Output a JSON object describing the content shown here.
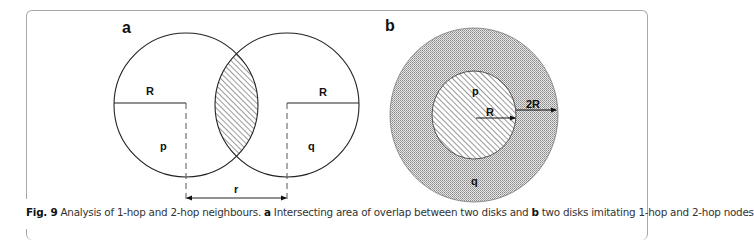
{
  "figure": {
    "panel_a": {
      "label": "a",
      "radius_left": "R",
      "radius_right": "R",
      "node_left": "p",
      "node_right": "q",
      "distance": "r"
    },
    "panel_b": {
      "label": "b",
      "inner_node": "p",
      "outer_node": "q",
      "inner_radius": "R",
      "outer_radius": "2R"
    }
  },
  "caption": {
    "fig_label": "Fig. 9",
    "text_1": " Analysis of 1-hop and 2-hop neighbours. ",
    "a": "a",
    "text_2": " Intersecting area of overlap between two disks and ",
    "b": "b",
    "text_3": " two disks imitating 1-hop and 2-hop nodes"
  },
  "colors": {
    "stroke": "#222222",
    "dot_fill": "#bdbdbd",
    "frame": "#a8a8a8"
  }
}
